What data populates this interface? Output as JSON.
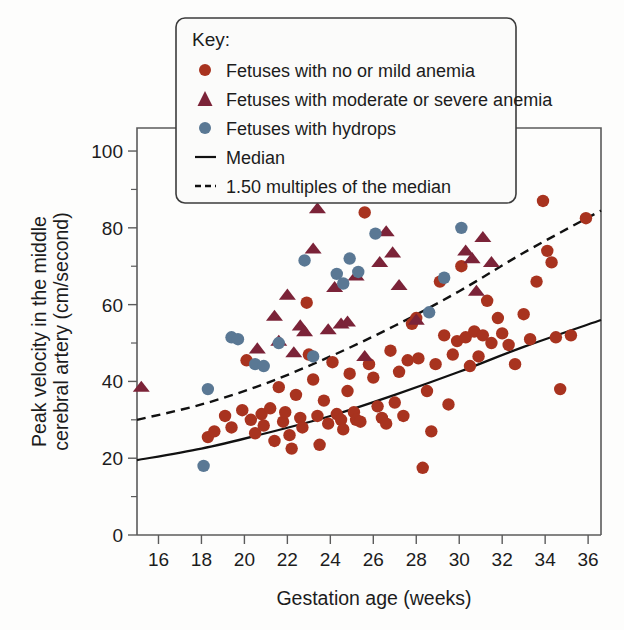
{
  "chart_data": {
    "type": "scatter",
    "title": "",
    "xlabel": "Gestation age (weeks)",
    "ylabel": "Peak velocity in the middle cerebral artery (cm/second)",
    "ylabel_line1": "Peak velocity in the middle",
    "ylabel_line2": "cerebral artery (cm/second)",
    "xlim": [
      15,
      36.6
    ],
    "ylim": [
      0,
      106
    ],
    "xticks": [
      16,
      18,
      20,
      22,
      24,
      26,
      28,
      30,
      32,
      34,
      36
    ],
    "xticklabels": [
      "16",
      "18",
      "20",
      "22",
      "24",
      "26",
      "28",
      "30",
      "32",
      "34",
      "36"
    ],
    "yticks": [
      0,
      20,
      40,
      60,
      80,
      100
    ],
    "yticklabels": [
      "0",
      "20",
      "40",
      "60",
      "80",
      "100"
    ],
    "yticks_minor": [
      10,
      30,
      50,
      70,
      90
    ],
    "grid": false,
    "legend_position": "top-center-above-axes",
    "colors": {
      "mild": "#a8331f",
      "severe": "#7b2338",
      "hydrops": "#5a7894",
      "median": "#111111",
      "mom": "#111111",
      "frame": "#5b5b5b"
    },
    "series": [
      {
        "name": "Fetuses with no or mild anemia",
        "marker": "circle",
        "color": "#a8331f",
        "points": [
          [
            18.3,
            25.5
          ],
          [
            18.6,
            27.0
          ],
          [
            19.1,
            31.0
          ],
          [
            19.4,
            28.0
          ],
          [
            19.9,
            32.5
          ],
          [
            20.1,
            45.5
          ],
          [
            20.3,
            30.0
          ],
          [
            20.5,
            26.5
          ],
          [
            20.8,
            31.5
          ],
          [
            20.9,
            28.5
          ],
          [
            21.2,
            33.0
          ],
          [
            21.4,
            24.5
          ],
          [
            21.6,
            38.5
          ],
          [
            21.8,
            29.5
          ],
          [
            21.9,
            32.0
          ],
          [
            22.1,
            26.0
          ],
          [
            22.2,
            22.5
          ],
          [
            22.4,
            36.5
          ],
          [
            22.6,
            30.5
          ],
          [
            22.7,
            28.0
          ],
          [
            22.9,
            60.5
          ],
          [
            23.0,
            47.0
          ],
          [
            23.2,
            40.5
          ],
          [
            23.4,
            31.0
          ],
          [
            23.5,
            23.5
          ],
          [
            23.7,
            35.0
          ],
          [
            23.9,
            29.0
          ],
          [
            24.1,
            45.0
          ],
          [
            24.3,
            31.5
          ],
          [
            24.5,
            30.0
          ],
          [
            24.6,
            27.5
          ],
          [
            24.8,
            37.5
          ],
          [
            24.9,
            42.0
          ],
          [
            25.1,
            32.0
          ],
          [
            25.2,
            30.0
          ],
          [
            25.4,
            29.5
          ],
          [
            25.6,
            84.0
          ],
          [
            25.8,
            44.5
          ],
          [
            26.0,
            41.0
          ],
          [
            26.2,
            33.5
          ],
          [
            26.4,
            30.5
          ],
          [
            26.6,
            29.0
          ],
          [
            26.8,
            48.0
          ],
          [
            27.0,
            34.5
          ],
          [
            27.2,
            42.5
          ],
          [
            27.4,
            31.0
          ],
          [
            27.6,
            45.5
          ],
          [
            27.8,
            55.0
          ],
          [
            28.0,
            56.5
          ],
          [
            28.1,
            46.0
          ],
          [
            28.3,
            17.5
          ],
          [
            28.5,
            37.5
          ],
          [
            28.7,
            27.0
          ],
          [
            28.9,
            44.5
          ],
          [
            29.1,
            66.0
          ],
          [
            29.3,
            52.0
          ],
          [
            29.5,
            34.0
          ],
          [
            29.7,
            47.0
          ],
          [
            29.9,
            50.5
          ],
          [
            30.1,
            70.0
          ],
          [
            30.3,
            51.5
          ],
          [
            30.5,
            44.0
          ],
          [
            30.7,
            53.0
          ],
          [
            30.9,
            46.5
          ],
          [
            31.1,
            52.0
          ],
          [
            31.3,
            61.0
          ],
          [
            31.5,
            50.0
          ],
          [
            31.8,
            56.5
          ],
          [
            32.0,
            52.5
          ],
          [
            32.3,
            49.5
          ],
          [
            32.6,
            44.5
          ],
          [
            33.0,
            57.5
          ],
          [
            33.3,
            51.0
          ],
          [
            33.6,
            66.0
          ],
          [
            33.9,
            87.0
          ],
          [
            34.1,
            74.0
          ],
          [
            34.3,
            71.0
          ],
          [
            34.5,
            51.5
          ],
          [
            34.7,
            38.0
          ],
          [
            35.2,
            52.0
          ],
          [
            35.9,
            82.5
          ]
        ]
      },
      {
        "name": "Fetuses with moderate or severe anemia",
        "marker": "triangle",
        "color": "#7b2338",
        "points": [
          [
            15.2,
            38.5
          ],
          [
            20.6,
            48.5
          ],
          [
            21.4,
            57.0
          ],
          [
            21.6,
            50.5
          ],
          [
            22.0,
            62.5
          ],
          [
            22.3,
            47.5
          ],
          [
            22.6,
            54.5
          ],
          [
            22.8,
            53.0
          ],
          [
            23.2,
            74.5
          ],
          [
            23.4,
            85.0
          ],
          [
            23.6,
            88.0
          ],
          [
            23.9,
            53.5
          ],
          [
            24.2,
            64.5
          ],
          [
            24.5,
            55.0
          ],
          [
            24.8,
            55.5
          ],
          [
            25.2,
            67.5
          ],
          [
            25.6,
            46.5
          ],
          [
            25.9,
            88.5
          ],
          [
            26.3,
            71.0
          ],
          [
            26.6,
            79.0
          ],
          [
            26.9,
            73.5
          ],
          [
            27.2,
            65.0
          ],
          [
            28.0,
            56.0
          ],
          [
            30.3,
            74.0
          ],
          [
            30.6,
            72.0
          ],
          [
            30.8,
            63.5
          ],
          [
            31.1,
            77.5
          ],
          [
            31.5,
            71.0
          ]
        ]
      },
      {
        "name": "Fetuses with hydrops",
        "marker": "circle",
        "color": "#5a7894",
        "points": [
          [
            18.1,
            18.0
          ],
          [
            18.3,
            38.0
          ],
          [
            19.4,
            51.5
          ],
          [
            19.7,
            51.0
          ],
          [
            20.5,
            44.5
          ],
          [
            20.9,
            44.0
          ],
          [
            21.6,
            50.0
          ],
          [
            22.8,
            71.5
          ],
          [
            23.2,
            46.5
          ],
          [
            24.3,
            68.0
          ],
          [
            24.6,
            65.5
          ],
          [
            24.9,
            72.0
          ],
          [
            25.3,
            68.5
          ],
          [
            26.1,
            78.5
          ],
          [
            28.6,
            58.0
          ],
          [
            29.3,
            67.0
          ],
          [
            29.9,
            93.0
          ],
          [
            30.1,
            80.0
          ]
        ]
      }
    ],
    "curves": [
      {
        "name": "Median",
        "style": "solid",
        "points": [
          [
            15,
            19.5
          ],
          [
            18,
            22.5
          ],
          [
            21,
            26.5
          ],
          [
            24,
            31.0
          ],
          [
            27,
            36.5
          ],
          [
            30,
            42.5
          ],
          [
            33,
            49.0
          ],
          [
            36.6,
            56.0
          ]
        ]
      },
      {
        "name": "1.50 multiples of the median",
        "style": "dashed",
        "points": [
          [
            15,
            30.0
          ],
          [
            18,
            34.0
          ],
          [
            21,
            39.5
          ],
          [
            24,
            46.5
          ],
          [
            27,
            54.5
          ],
          [
            30,
            63.5
          ],
          [
            33,
            73.5
          ],
          [
            36.6,
            84.5
          ]
        ]
      }
    ]
  },
  "legend": {
    "title": "Key:",
    "entries": [
      {
        "label": "Fetuses with no or mild anemia",
        "marker": "circle",
        "color": "#a8331f"
      },
      {
        "label": "Fetuses with moderate or severe anemia",
        "marker": "triangle",
        "color": "#7b2338"
      },
      {
        "label": "Fetuses with hydrops",
        "marker": "circle",
        "color": "#5a7894"
      },
      {
        "label": "Median",
        "marker": "solid-line",
        "color": "#111111"
      },
      {
        "label": "1.50 multiples of the median",
        "marker": "dashed-line",
        "color": "#111111"
      }
    ]
  }
}
